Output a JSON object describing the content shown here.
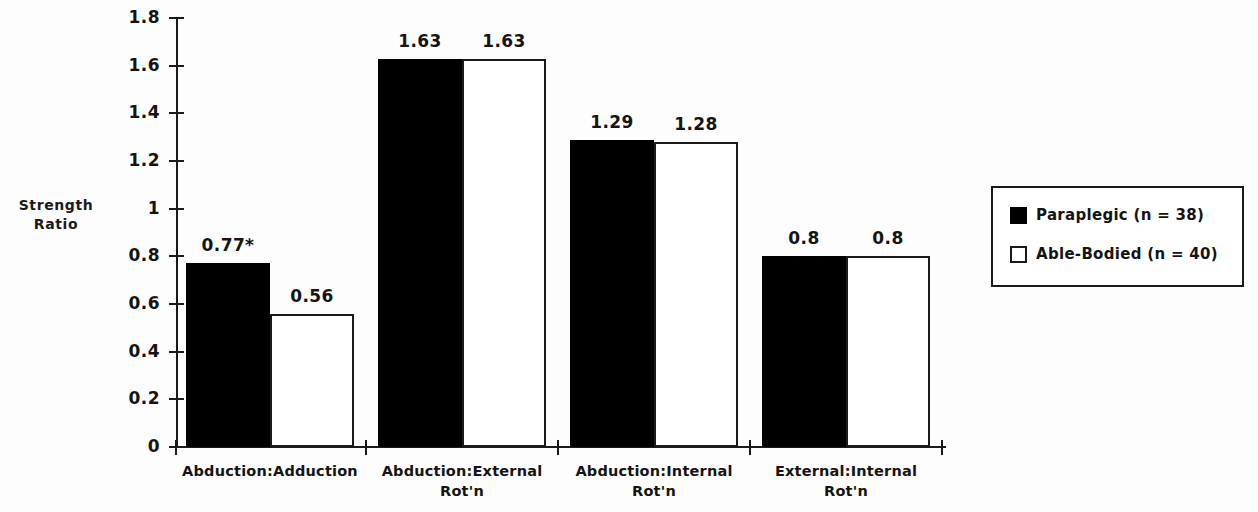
{
  "chart_data": {
    "type": "bar",
    "title": "",
    "xlabel": "",
    "ylabel": "Strength\nRatio",
    "ylabel_lines": [
      "Strength",
      "Ratio"
    ],
    "ylim": [
      0,
      1.8
    ],
    "ytick_labels": [
      "0",
      "0.2",
      "0.4",
      "0.6",
      "0.8",
      "1",
      "1.2",
      "1.4",
      "1.6",
      "1.8"
    ],
    "ytick_values": [
      0,
      0.2,
      0.4,
      0.6,
      0.8,
      1,
      1.2,
      1.4,
      1.6,
      1.8
    ],
    "grid": false,
    "legend_position": "right",
    "categories": [
      "Abduction:Adduction",
      "Abduction:External Rot'n",
      "Abduction:Internal Rot'n",
      "External:Internal Rot'n"
    ],
    "category_lines": [
      [
        "Abduction:Adduction"
      ],
      [
        "Abduction:External",
        "Rot'n"
      ],
      [
        "Abduction:Internal",
        "Rot'n"
      ],
      [
        "External:Internal",
        "Rot'n"
      ]
    ],
    "series": [
      {
        "name": "Paraplegic (n = 38)",
        "color": "#000000",
        "fill": "solid",
        "values": [
          0.77,
          1.63,
          1.29,
          0.8
        ],
        "labels": [
          "0.77*",
          "1.63",
          "1.29",
          "0.8"
        ]
      },
      {
        "name": "Able-Bodied (n = 40)",
        "color": "#ffffff",
        "fill": "outline",
        "values": [
          0.56,
          1.63,
          1.28,
          0.8
        ],
        "labels": [
          "0.56",
          "1.63",
          "1.28",
          "0.8"
        ]
      }
    ],
    "annotations": [
      "* denotes significant difference"
    ]
  },
  "legend": {
    "entries": [
      {
        "label": "Paraplegic (n = 38)",
        "swatch": "filled-black-square"
      },
      {
        "label": "Able-Bodied (n = 40)",
        "swatch": "outlined-white-square"
      }
    ]
  },
  "axis": {
    "y_title_line1": "Strength",
    "y_title_line2": "Ratio"
  }
}
